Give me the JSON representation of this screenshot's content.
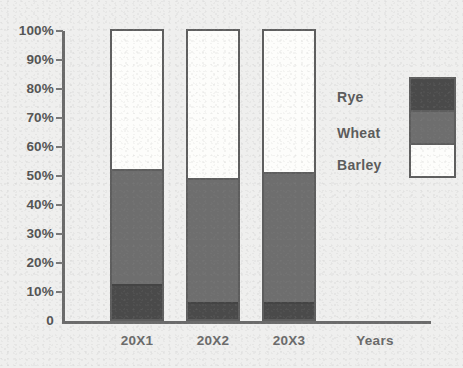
{
  "chart_data": {
    "type": "bar",
    "subtype": "stacked-100-percent",
    "title": "",
    "xlabel": "Years",
    "ylabel": "",
    "categories": [
      "20X1",
      "20X2",
      "20X3"
    ],
    "series": [
      {
        "name": "Rye",
        "color": "#4a4a4a",
        "values": [
          12,
          6,
          6
        ]
      },
      {
        "name": "Wheat",
        "color": "#6e6e6e",
        "values": [
          40,
          43,
          45
        ]
      },
      {
        "name": "Barley",
        "color": "#fdfdfb",
        "values": [
          48,
          51,
          49
        ]
      }
    ],
    "stack_tops": {
      "rye": [
        12,
        6,
        6
      ],
      "wheat": [
        52,
        49,
        51
      ],
      "barley": [
        100,
        100,
        100
      ]
    },
    "ylim": [
      0,
      100
    ],
    "y_ticks": [
      "0",
      "10%",
      "20%",
      "30%",
      "40%",
      "50%",
      "60%",
      "70%",
      "80%",
      "90%",
      "100%"
    ],
    "grid": false,
    "legend_position": "right"
  },
  "axis": {
    "y_tick_labels": [
      {
        "label": "100%",
        "value": 100
      },
      {
        "label": "90%",
        "value": 90
      },
      {
        "label": "80%",
        "value": 80
      },
      {
        "label": "70%",
        "value": 70
      },
      {
        "label": "60%",
        "value": 60
      },
      {
        "label": "50%",
        "value": 50
      },
      {
        "label": "40%",
        "value": 40
      },
      {
        "label": "30%",
        "value": 30
      },
      {
        "label": "20%",
        "value": 20
      },
      {
        "label": "10%",
        "value": 10
      },
      {
        "label": "0",
        "value": 0
      }
    ],
    "x_tick_labels": [
      "20X1",
      "20X2",
      "20X3"
    ],
    "x_axis_title": "Years"
  },
  "legend": {
    "entries": [
      {
        "label": "Rye",
        "color": "#4a4a4a"
      },
      {
        "label": "Wheat",
        "color": "#6e6e6e"
      },
      {
        "label": "Barley",
        "color": "#ffffff"
      }
    ]
  },
  "colors": {
    "background": "#efefee",
    "axis": "#6b6b6b",
    "outline": "#5e5e5e",
    "text": "#585858"
  }
}
